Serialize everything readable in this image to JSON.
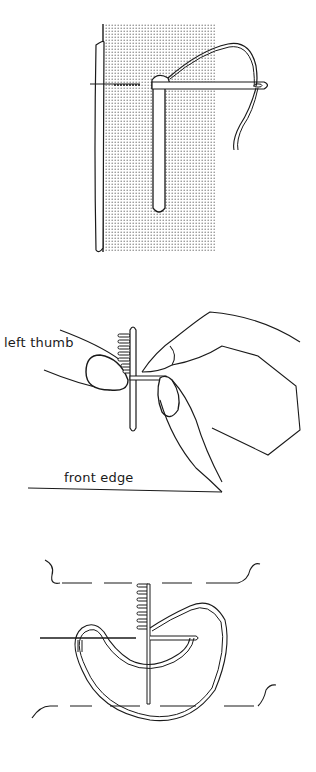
{
  "figures": [
    {
      "id": "figure-1",
      "description": "Needle passing through fabric beside a stick/strip on stippled fabric"
    },
    {
      "id": "figure-2",
      "description": "Hands holding stitched strip",
      "labels": {
        "left_thumb": "left thumb",
        "front_edge": "front edge"
      }
    },
    {
      "id": "figure-3",
      "description": "Thread looped around needle between dashed fabric edges"
    }
  ],
  "colors": {
    "ink": "#1a1a1a",
    "stipple": "#b8b8b8",
    "background": "#ffffff"
  }
}
